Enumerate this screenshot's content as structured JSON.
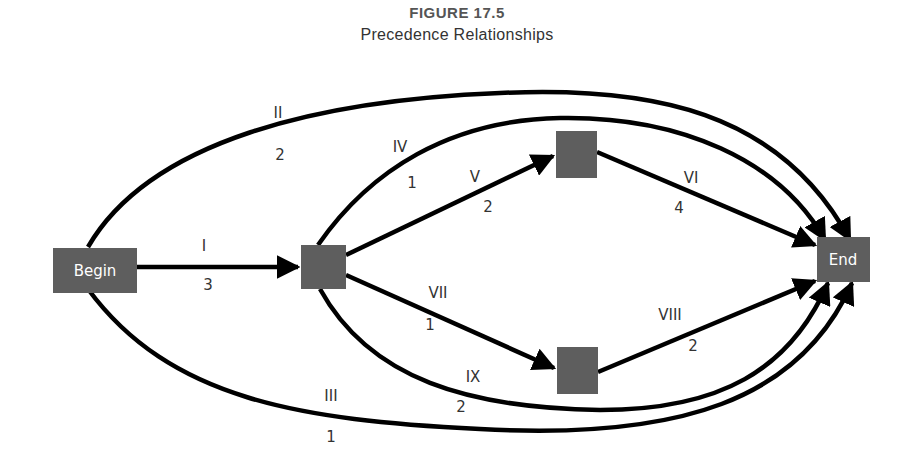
{
  "figure": {
    "number": "FIGURE 17.5",
    "title": "Precedence Relationships"
  },
  "nodes": {
    "begin": {
      "label": "Begin",
      "color": "#5e5e5e"
    },
    "a": {
      "label": ""
    },
    "b": {
      "label": ""
    },
    "c": {
      "label": ""
    },
    "end": {
      "label": "End",
      "color": "#5e5e5e"
    }
  },
  "edges": [
    {
      "id": "I",
      "from": "begin",
      "to": "a",
      "label": "I",
      "duration": "3"
    },
    {
      "id": "II",
      "from": "begin",
      "to": "end",
      "label": "II",
      "duration": "2"
    },
    {
      "id": "III",
      "from": "begin",
      "to": "end",
      "label": "III",
      "duration": "1"
    },
    {
      "id": "IV",
      "from": "a",
      "to": "end",
      "label": "IV",
      "duration": "1"
    },
    {
      "id": "V",
      "from": "a",
      "to": "b",
      "label": "V",
      "duration": "2"
    },
    {
      "id": "VI",
      "from": "b",
      "to": "end",
      "label": "VI",
      "duration": "4"
    },
    {
      "id": "VII",
      "from": "a",
      "to": "c",
      "label": "VII",
      "duration": "1"
    },
    {
      "id": "VIII",
      "from": "c",
      "to": "end",
      "label": "VIII",
      "duration": "2"
    },
    {
      "id": "IX",
      "from": "a",
      "to": "end",
      "label": "IX",
      "duration": "2"
    }
  ]
}
